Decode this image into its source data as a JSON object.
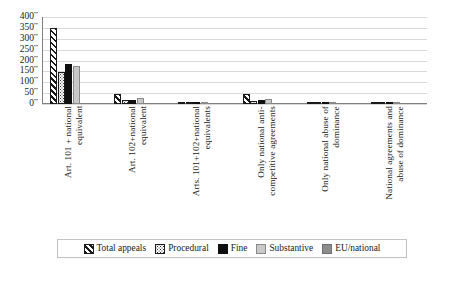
{
  "chart_data": {
    "type": "bar",
    "title": "",
    "xlabel": "",
    "ylabel": "",
    "ylim": [
      0,
      400
    ],
    "ytick_step": 50,
    "yticks": [
      "400",
      "350",
      "300",
      "250",
      "200",
      "150",
      "100",
      "50",
      "0"
    ],
    "grid": true,
    "legend_position": "bottom",
    "categories": [
      "Art. 101 + national\nequivalent",
      "Art. 102+national\nequivalent",
      "Arts. 101+102+national\nequivalents",
      "Only national anti-\ncompetitive agreements",
      "Only national abuse of\ndominance",
      "National agreements and\nabuse of dominance"
    ],
    "series": [
      {
        "name": "Total appeals",
        "style": "diagonal-hatch",
        "color": "#1a1a1a",
        "values": [
          350,
          46,
          8,
          46,
          5,
          3
        ]
      },
      {
        "name": "Procedural",
        "style": "dotted",
        "color": "#3a3a3a",
        "values": [
          145,
          18,
          3,
          15,
          2,
          1
        ]
      },
      {
        "name": "Fine",
        "style": "solid-black",
        "color": "#101010",
        "values": [
          182,
          20,
          4,
          19,
          2,
          1
        ]
      },
      {
        "name": "Substantive",
        "style": "solid-lightgray",
        "color": "#c9c9c9",
        "values": [
          177,
          28,
          5,
          22,
          3,
          2
        ]
      },
      {
        "name": "EU/national",
        "style": "solid-gray",
        "color": "#8d8d8d",
        "values": [
          0,
          0,
          0,
          0,
          0,
          0
        ]
      }
    ]
  },
  "legend": {
    "items": [
      {
        "label": "Total appeals"
      },
      {
        "label": "Procedural"
      },
      {
        "label": "Fine"
      },
      {
        "label": "Substantive"
      },
      {
        "label": "EU/national"
      }
    ]
  }
}
